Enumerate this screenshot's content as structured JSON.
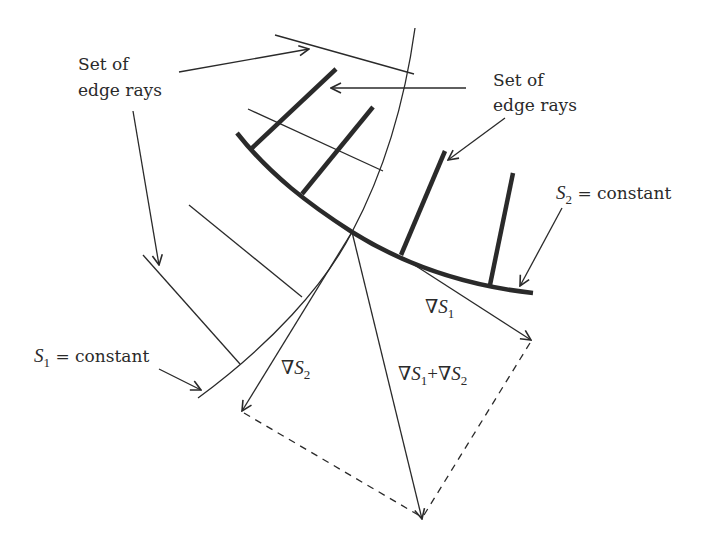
{
  "diagram": {
    "labels": {
      "edge_rays_left_line1": "Set of",
      "edge_rays_left_line2": "edge rays",
      "edge_rays_right_line1": "Set of",
      "edge_rays_right_line2": "edge rays",
      "s2_symbol": "S",
      "s2_sub": "2",
      "s2_rest": " = constant",
      "s1_symbol": "S",
      "s1_sub": "1",
      "s1_rest": " = constant",
      "grad_s1_nabla": "∇",
      "grad_s1_symbol": "S",
      "grad_s1_sub": "1",
      "grad_s2_nabla": "∇",
      "grad_s2_symbol": "S",
      "grad_s2_sub": "2",
      "sum_nabla1": "∇",
      "sum_symbol1": "S",
      "sum_sub1": "1",
      "sum_plus": "+",
      "sum_nabla2": "∇",
      "sum_symbol2": "S",
      "sum_sub2": "2"
    },
    "colors": {
      "ink": "#2a2a2a",
      "background": "#ffffff"
    }
  }
}
